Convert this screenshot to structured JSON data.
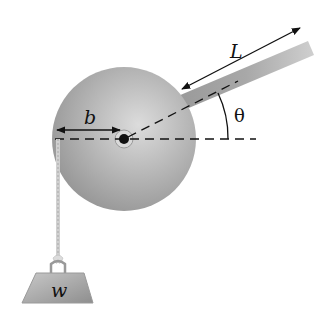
{
  "diagram": {
    "labels": {
      "rod_length": "L",
      "radius": "b",
      "angle": "θ",
      "weight": "w"
    },
    "colors": {
      "disk_light": "#d8d8d8",
      "disk_dark": "#8a8a8a",
      "rod": "#b8b8b8",
      "line": "#111111",
      "background": "#ffffff"
    },
    "geometry": {
      "disk_center": [
        124,
        139
      ],
      "disk_radius": 72,
      "rod_angle_deg": 22
    }
  }
}
